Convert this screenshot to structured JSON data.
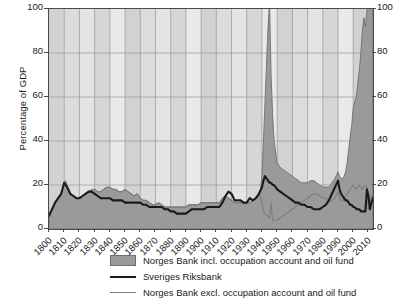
{
  "chart_data": {
    "type": "area",
    "title": "",
    "subtitle": "",
    "xlabel": "",
    "ylabel": "Percentage of GDP",
    "xlim": [
      1800,
      2013
    ],
    "ylim": [
      0,
      100
    ],
    "grid": true,
    "legend_position": "below",
    "y_ticks": [
      0,
      20,
      40,
      60,
      80,
      100
    ],
    "y_ticks_right": [
      0,
      20,
      40,
      60,
      80,
      100
    ],
    "x_ticks": [
      1800,
      1810,
      1820,
      1830,
      1840,
      1850,
      1860,
      1870,
      1880,
      1890,
      1900,
      1910,
      1920,
      1930,
      1940,
      1950,
      1960,
      1970,
      1980,
      1990,
      2000,
      2010
    ],
    "colors": {
      "area_fill": "#9a9a9a",
      "area_edge": "#6e6e6e",
      "sveriges_line": "#1a1a1a",
      "norges_excl_line": "#7d7d7d",
      "plot_background": "#d4d4d4",
      "grid_line": "#9e9e9e",
      "frame": "#4a4a4a"
    },
    "series": [
      {
        "name": "Norges Bank incl. occupation account and oil fund",
        "style": "filled-area",
        "x": [
          1800,
          1802,
          1804,
          1806,
          1808,
          1810,
          1811,
          1812,
          1814,
          1816,
          1818,
          1820,
          1822,
          1824,
          1826,
          1828,
          1830,
          1832,
          1834,
          1836,
          1838,
          1840,
          1842,
          1844,
          1846,
          1848,
          1850,
          1852,
          1854,
          1856,
          1858,
          1860,
          1862,
          1864,
          1866,
          1868,
          1870,
          1872,
          1874,
          1876,
          1878,
          1880,
          1882,
          1884,
          1886,
          1888,
          1890,
          1892,
          1894,
          1896,
          1898,
          1900,
          1902,
          1904,
          1906,
          1908,
          1910,
          1912,
          1914,
          1916,
          1918,
          1920,
          1922,
          1924,
          1926,
          1928,
          1930,
          1932,
          1934,
          1936,
          1938,
          1939,
          1940,
          1941,
          1942,
          1943,
          1944,
          1945,
          1946,
          1947,
          1948,
          1950,
          1952,
          1954,
          1956,
          1958,
          1960,
          1962,
          1964,
          1966,
          1968,
          1970,
          1972,
          1974,
          1976,
          1978,
          1980,
          1982,
          1984,
          1986,
          1988,
          1990,
          1991,
          1992,
          1993,
          1994,
          1995,
          1996,
          1997,
          1998,
          1999,
          2000,
          2001,
          2002,
          2003,
          2004,
          2005,
          2006,
          2007,
          2008,
          2009,
          2010,
          2011,
          2012,
          2013
        ],
        "y": [
          6,
          9,
          12,
          14,
          16,
          21,
          22,
          19,
          16,
          15,
          14,
          14,
          15,
          16,
          17,
          18,
          18,
          17,
          17,
          18,
          19,
          19,
          18,
          18,
          17,
          17,
          18,
          17,
          16,
          15,
          16,
          14,
          13,
          13,
          12,
          11,
          11,
          12,
          11,
          10,
          10,
          10,
          10,
          10,
          10,
          10,
          10,
          11,
          11,
          11,
          11,
          12,
          12,
          12,
          12,
          12,
          12,
          12,
          14,
          15,
          14,
          13,
          12,
          12,
          12,
          12,
          12,
          12,
          13,
          14,
          16,
          18,
          24,
          40,
          58,
          75,
          92,
          103,
          70,
          52,
          40,
          30,
          28,
          27,
          26,
          25,
          24,
          23,
          22,
          21,
          21,
          21,
          22,
          22,
          21,
          20,
          19,
          19,
          19,
          21,
          23,
          26,
          24,
          23,
          23,
          24,
          26,
          30,
          36,
          42,
          47,
          55,
          58,
          60,
          66,
          72,
          80,
          90,
          96,
          92,
          99,
          104,
          108,
          112,
          115
        ]
      },
      {
        "name": "Sveriges Riksbank",
        "style": "thick-line",
        "x": [
          1800,
          1802,
          1804,
          1806,
          1808,
          1810,
          1812,
          1814,
          1816,
          1818,
          1820,
          1822,
          1824,
          1826,
          1828,
          1830,
          1832,
          1834,
          1836,
          1838,
          1840,
          1842,
          1844,
          1846,
          1848,
          1850,
          1852,
          1854,
          1856,
          1858,
          1860,
          1862,
          1864,
          1866,
          1868,
          1870,
          1872,
          1874,
          1876,
          1878,
          1880,
          1882,
          1884,
          1886,
          1888,
          1890,
          1892,
          1894,
          1896,
          1898,
          1900,
          1902,
          1904,
          1906,
          1908,
          1910,
          1912,
          1914,
          1916,
          1918,
          1920,
          1922,
          1924,
          1926,
          1928,
          1930,
          1932,
          1934,
          1936,
          1938,
          1940,
          1941,
          1942,
          1943,
          1944,
          1945,
          1946,
          1947,
          1948,
          1950,
          1952,
          1954,
          1956,
          1958,
          1960,
          1962,
          1964,
          1966,
          1968,
          1970,
          1972,
          1974,
          1976,
          1978,
          1980,
          1982,
          1984,
          1986,
          1988,
          1990,
          1991,
          1992,
          1993,
          1994,
          1995,
          1996,
          1997,
          1998,
          1999,
          2000,
          2001,
          2002,
          2003,
          2004,
          2005,
          2006,
          2007,
          2008,
          2009,
          2010,
          2011,
          2012,
          2013
        ],
        "y": [
          6,
          9,
          12,
          14,
          16,
          21,
          19,
          16,
          15,
          14,
          14,
          15,
          16,
          17,
          17,
          16,
          15,
          14,
          14,
          14,
          14,
          13,
          13,
          13,
          13,
          12,
          12,
          12,
          12,
          12,
          12,
          11,
          11,
          10,
          10,
          10,
          10,
          10,
          9,
          9,
          8,
          8,
          7,
          7,
          7,
          7,
          8,
          9,
          9,
          9,
          9,
          9,
          10,
          10,
          10,
          10,
          10,
          12,
          15,
          17,
          16,
          13,
          13,
          13,
          12,
          12,
          14,
          13,
          14,
          16,
          19,
          22,
          24,
          23,
          22,
          21,
          21,
          20,
          20,
          18,
          17,
          16,
          15,
          14,
          13,
          12,
          12,
          11,
          11,
          10,
          10,
          9,
          9,
          9,
          10,
          11,
          13,
          16,
          19,
          22,
          18,
          16,
          15,
          14,
          13,
          13,
          12,
          11,
          11,
          10,
          10,
          9,
          9,
          9,
          8,
          8,
          8,
          8,
          18,
          15,
          9,
          12,
          14
        ]
      },
      {
        "name": "Norges Bank excl. occupation account and oil fund",
        "style": "thin-line",
        "x": [
          1830,
          1832,
          1834,
          1836,
          1838,
          1840,
          1842,
          1844,
          1846,
          1848,
          1850,
          1852,
          1854,
          1856,
          1858,
          1860,
          1862,
          1864,
          1866,
          1868,
          1870,
          1872,
          1874,
          1876,
          1878,
          1880,
          1882,
          1884,
          1886,
          1888,
          1890,
          1892,
          1894,
          1896,
          1898,
          1900,
          1902,
          1904,
          1906,
          1908,
          1910,
          1912,
          1914,
          1916,
          1918,
          1920,
          1922,
          1924,
          1926,
          1928,
          1930,
          1932,
          1934,
          1936,
          1938,
          1940,
          1941,
          1942,
          1943,
          1944,
          1945,
          1946,
          1947,
          1948,
          1950,
          1952,
          1954,
          1956,
          1958,
          1960,
          1962,
          1964,
          1966,
          1968,
          1970,
          1972,
          1974,
          1976,
          1978,
          1980,
          1982,
          1984,
          1986,
          1988,
          1990,
          1991,
          1992,
          1993,
          1994,
          1995,
          1996,
          1997,
          1998,
          1999,
          2000,
          2001,
          2002,
          2003,
          2004,
          2005,
          2006,
          2007,
          2008,
          2009,
          2010,
          2011,
          2012,
          2013
        ],
        "y": [
          18,
          17,
          17,
          18,
          19,
          19,
          18,
          18,
          17,
          17,
          18,
          17,
          16,
          15,
          16,
          14,
          13,
          13,
          12,
          11,
          11,
          12,
          11,
          10,
          10,
          10,
          10,
          10,
          10,
          10,
          10,
          11,
          11,
          11,
          11,
          12,
          12,
          12,
          12,
          12,
          12,
          12,
          14,
          15,
          14,
          13,
          12,
          12,
          12,
          12,
          12,
          12,
          13,
          14,
          16,
          12,
          8,
          7,
          6,
          6,
          5,
          12,
          4,
          4,
          4,
          5,
          6,
          7,
          8,
          9,
          10,
          11,
          12,
          13,
          14,
          15,
          16,
          16,
          15,
          14,
          14,
          13,
          13,
          14,
          17,
          14,
          13,
          13,
          14,
          15,
          16,
          17,
          18,
          19,
          20,
          19,
          18,
          19,
          20,
          19,
          18,
          19,
          20,
          19,
          9,
          12,
          15,
          14
        ]
      }
    ]
  },
  "legend": {
    "items": [
      {
        "label": "Norges Bank incl. occupation account and oil fund",
        "key": "patch"
      },
      {
        "label": "Sveriges Riksbank",
        "key": "line-thick"
      },
      {
        "label": "Norges Bank excl. occupation account and oil fund",
        "key": "line-thin"
      }
    ]
  }
}
